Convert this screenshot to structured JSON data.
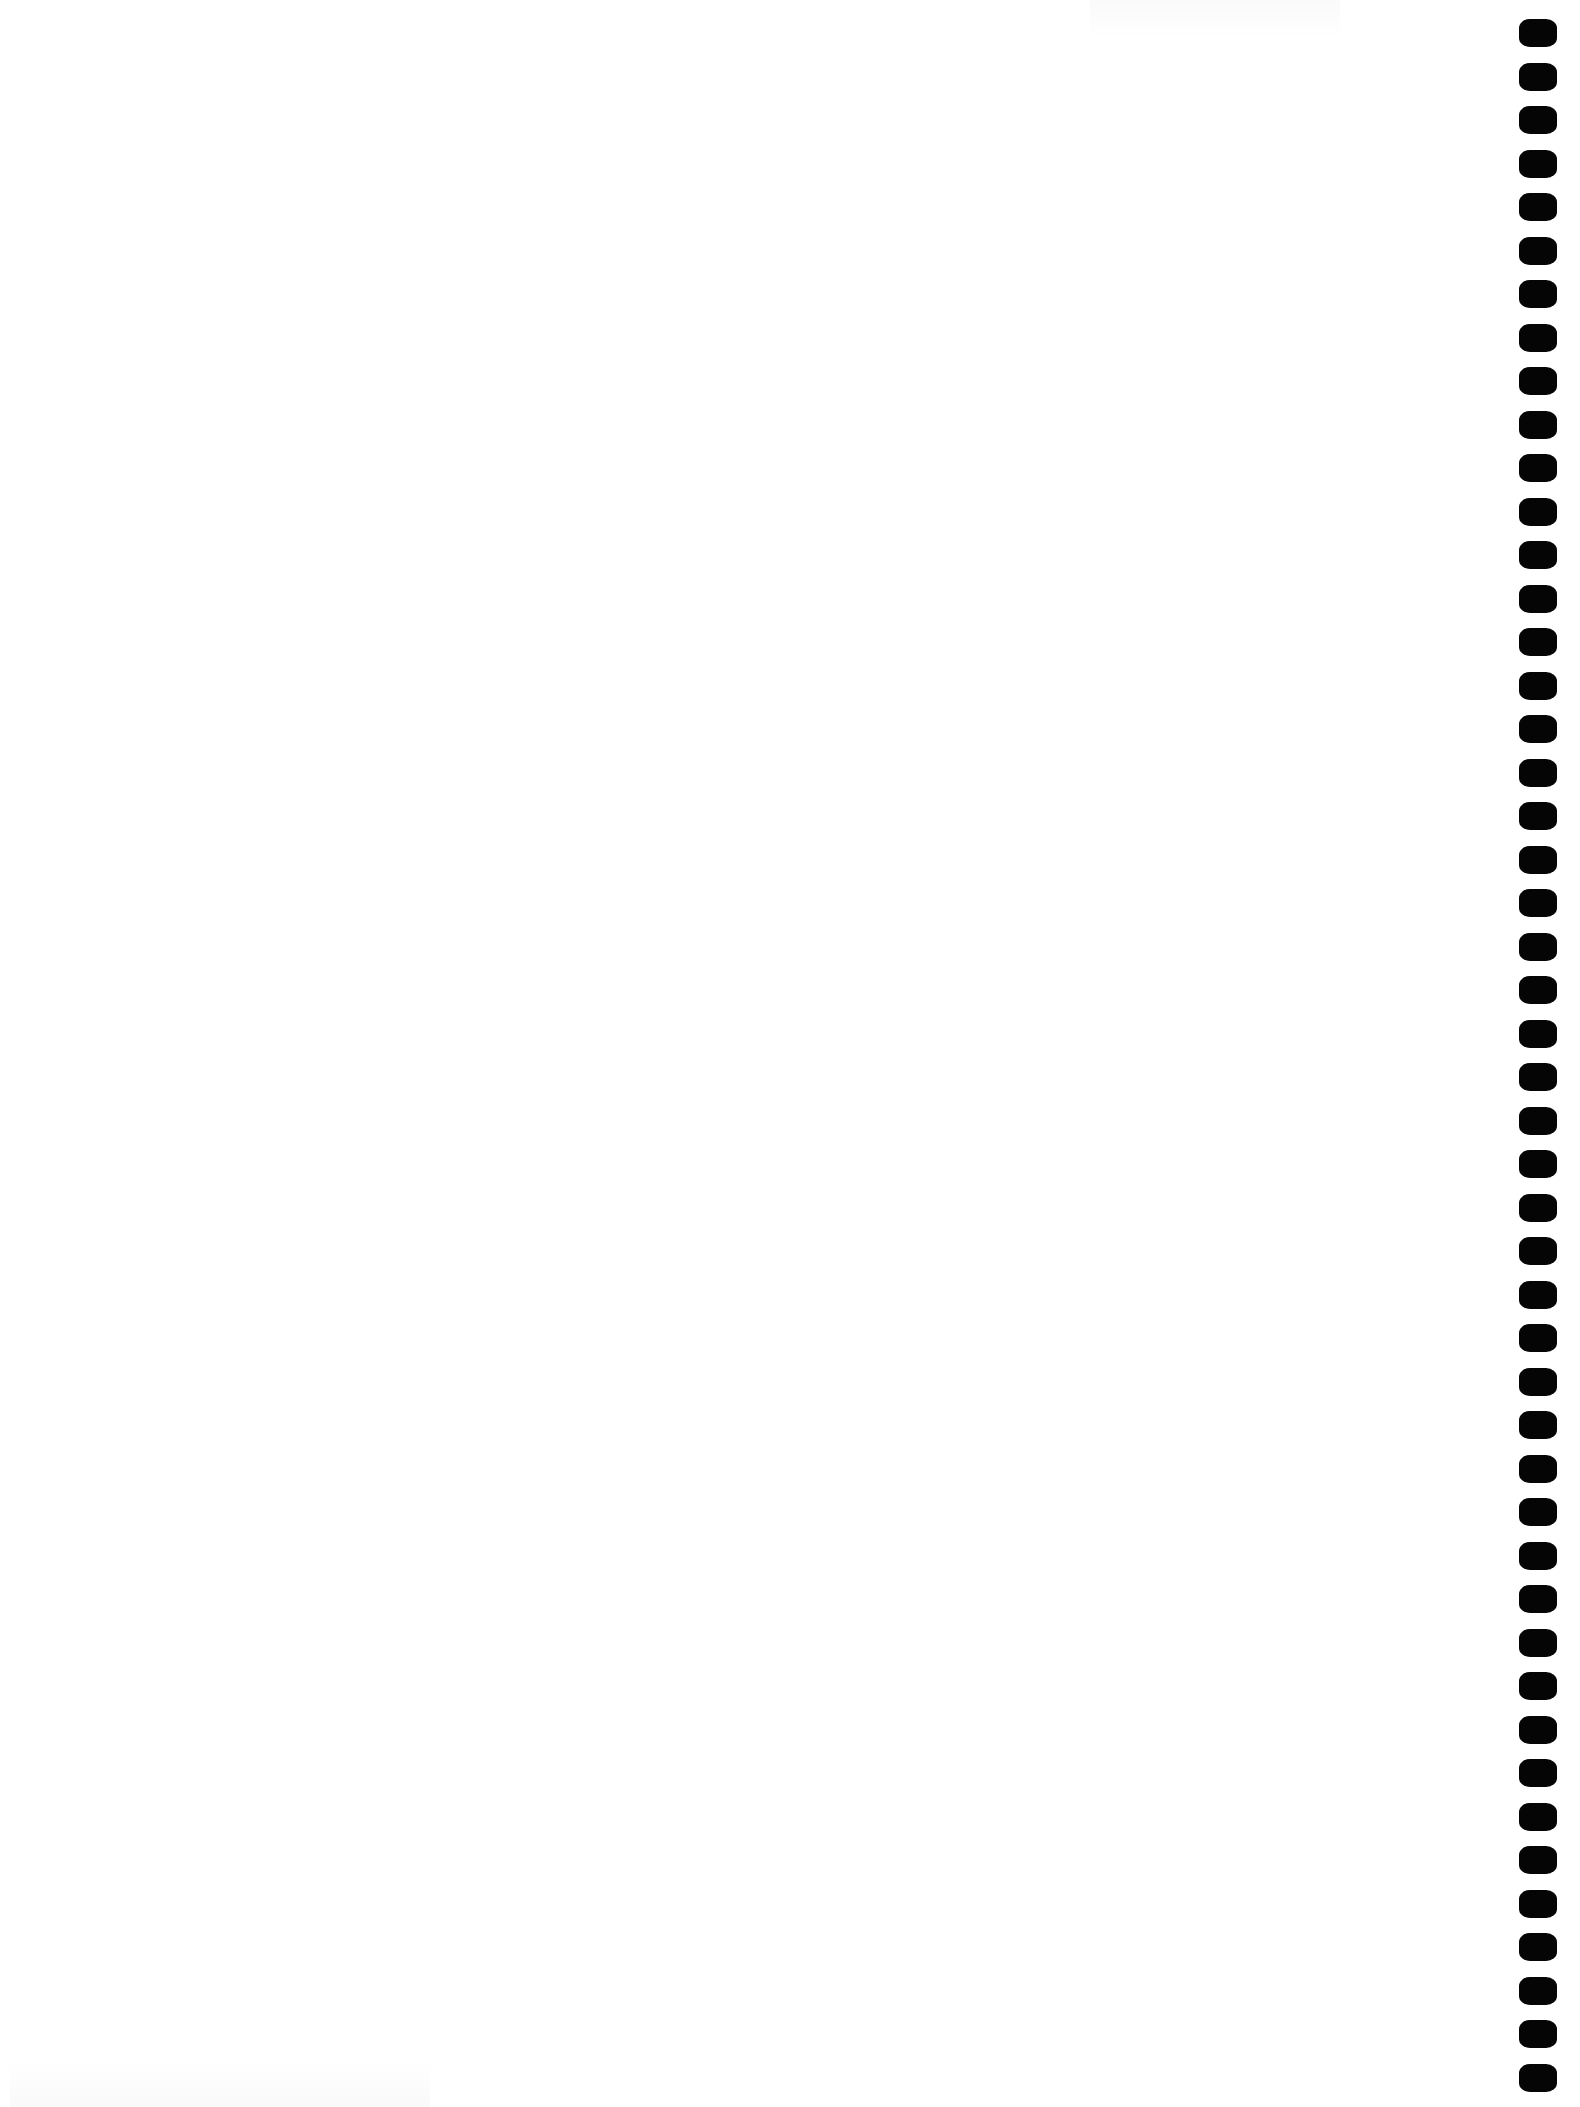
{
  "document": {
    "kind": "scanned-page",
    "page_state": "blank",
    "page_width": 1580,
    "page_height": 2107,
    "background_color": "#FFFFFF",
    "body_text": "",
    "visible_text_content": []
  },
  "binding": {
    "name": "binding-perforation-column",
    "edge": "right",
    "mark_shape": "rounded-rectangle",
    "mark_color": "#050505",
    "mark_width": 38,
    "mark_height": 28,
    "mark_spacing": 43.5,
    "first_mark_top": 19,
    "column_left": 1519,
    "right_margin": 23,
    "mark_count": 48
  },
  "artifacts": {
    "paper_tone": "#FFFFFF",
    "noise_present": true,
    "smudge_bottom_left": true,
    "smudge_top_right": true
  }
}
